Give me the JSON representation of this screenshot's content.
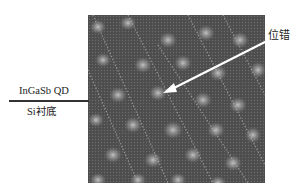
{
  "figure": {
    "type": "micrograph",
    "labels": {
      "quantum_dot": "InGaSb QD",
      "substrate": "Si衬底",
      "dislocation": "位错"
    },
    "colors": {
      "background": "#ffffff",
      "micrograph_base": "#4a4a4a",
      "arrow": "#ffffff",
      "text": "#222222",
      "interface_line": "#333333"
    }
  }
}
